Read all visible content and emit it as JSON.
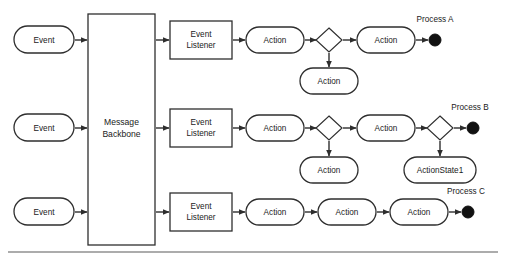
{
  "diagram": {
    "background_color": "#ffffff",
    "stroke_color": "#2e2e2e",
    "terminal_color": "#111111",
    "backbone": {
      "label_line1": "Message",
      "label_line2": "Backbone"
    },
    "events": [
      {
        "label": "Event"
      },
      {
        "label": "Event"
      },
      {
        "label": "Event"
      }
    ],
    "listeners": [
      {
        "label_line1": "Event",
        "label_line2": "Listener"
      },
      {
        "label_line1": "Event",
        "label_line2": "Listener"
      },
      {
        "label_line1": "Event",
        "label_line2": "Listener"
      }
    ],
    "lanes": [
      {
        "name": "lane-a",
        "process_label": "Process A",
        "main_actions": [
          {
            "label": "Action"
          },
          {
            "label": "Action"
          }
        ],
        "branch_actions": [
          {
            "label": "Action"
          }
        ],
        "decision_count": 1
      },
      {
        "name": "lane-b",
        "process_label": "Process B",
        "main_actions": [
          {
            "label": "Action"
          },
          {
            "label": "Action"
          }
        ],
        "branch_actions": [
          {
            "label": "Action"
          },
          {
            "label": "ActionState1"
          }
        ],
        "decision_count": 2
      },
      {
        "name": "lane-c",
        "process_label": "Process C",
        "main_actions": [
          {
            "label": "Action"
          },
          {
            "label": "Action"
          },
          {
            "label": "Action"
          }
        ],
        "branch_actions": [],
        "decision_count": 0
      }
    ]
  }
}
